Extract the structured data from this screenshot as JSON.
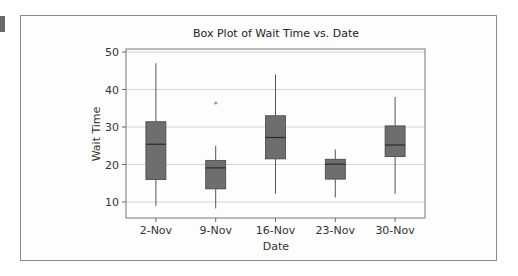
{
  "chart_data": {
    "type": "box",
    "title": "Box Plot of Wait Time vs. Date",
    "xlabel": "Date",
    "ylabel": "Wait Time",
    "ylim": [
      5,
      51
    ],
    "yticks": [
      10,
      20,
      30,
      40,
      50
    ],
    "grid": true,
    "legend": null,
    "categories": [
      "2-Nov",
      "9-Nov",
      "16-Nov",
      "23-Nov",
      "30-Nov"
    ],
    "boxes": [
      {
        "label": "2-Nov",
        "whisker_low": 9,
        "q1": 16,
        "median": 25.4,
        "q3": 31.4,
        "whisker_high": 47,
        "outliers": []
      },
      {
        "label": "9-Nov",
        "whisker_low": 8.3,
        "q1": 13.5,
        "median": 19.1,
        "q3": 21.1,
        "whisker_high": 25,
        "outliers": [
          36
        ]
      },
      {
        "label": "16-Nov",
        "whisker_low": 12.2,
        "q1": 21.5,
        "median": 27.2,
        "q3": 33,
        "whisker_high": 44,
        "outliers": []
      },
      {
        "label": "23-Nov",
        "whisker_low": 11.2,
        "q1": 16.1,
        "median": 20.1,
        "q3": 21.4,
        "whisker_high": 24,
        "outliers": []
      },
      {
        "label": "30-Nov",
        "whisker_low": 12.2,
        "q1": 22.1,
        "median": 25.2,
        "q3": 30.3,
        "whisker_high": 38,
        "outliers": []
      }
    ],
    "colors": {
      "box_fill": "#6e6e6e",
      "median": "#2a2a2a",
      "whisker": "#555555",
      "grid": "#d4d4d4",
      "outlier": "#777777"
    }
  }
}
